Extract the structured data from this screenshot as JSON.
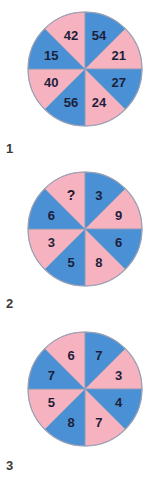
{
  "page": {
    "background_color": "#ffffff",
    "text_color": "#3a3a3a"
  },
  "palette": {
    "pink": "#f7b2c0",
    "blue": "#4a90d4",
    "outline": "#9aa0b4",
    "label_text": "#1c1f3b"
  },
  "puzzles": [
    {
      "number": "1",
      "sectors": [
        {
          "value": "42",
          "color": "pink"
        },
        {
          "value": "54",
          "color": "blue"
        },
        {
          "value": "21",
          "color": "pink"
        },
        {
          "value": "27",
          "color": "blue"
        },
        {
          "value": "24",
          "color": "pink"
        },
        {
          "value": "56",
          "color": "blue"
        },
        {
          "value": "40",
          "color": "pink"
        },
        {
          "value": "15",
          "color": "blue"
        }
      ]
    },
    {
      "number": "2",
      "sectors": [
        {
          "value": "?",
          "color": "pink"
        },
        {
          "value": "3",
          "color": "blue"
        },
        {
          "value": "9",
          "color": "pink"
        },
        {
          "value": "6",
          "color": "blue"
        },
        {
          "value": "8",
          "color": "pink"
        },
        {
          "value": "5",
          "color": "blue"
        },
        {
          "value": "3",
          "color": "pink"
        },
        {
          "value": "6",
          "color": "blue"
        }
      ]
    },
    {
      "number": "3",
      "sectors": [
        {
          "value": "6",
          "color": "pink"
        },
        {
          "value": "7",
          "color": "blue"
        },
        {
          "value": "3",
          "color": "pink"
        },
        {
          "value": "4",
          "color": "blue"
        },
        {
          "value": "7",
          "color": "pink"
        },
        {
          "value": "8",
          "color": "blue"
        },
        {
          "value": "5",
          "color": "pink"
        },
        {
          "value": "7",
          "color": "blue"
        }
      ]
    }
  ]
}
